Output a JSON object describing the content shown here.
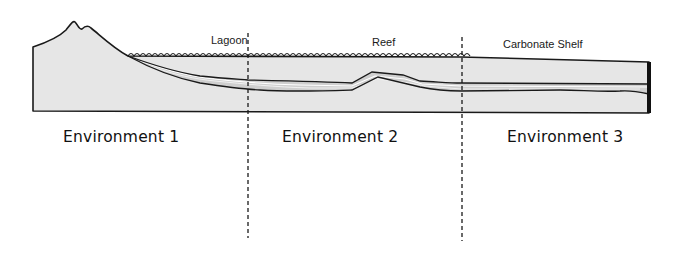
{
  "diagram": {
    "type": "geological cross-section",
    "regions": [
      {
        "label": "Lagoon"
      },
      {
        "label": "Reef"
      },
      {
        "label": "Carbonate Shelf"
      }
    ],
    "environments": [
      {
        "label": "Environment 1"
      },
      {
        "label": "Environment 2"
      },
      {
        "label": "Environment 3"
      }
    ],
    "features": {
      "volcano": "volcanic-island",
      "water_surface": "sea-surface-waves",
      "boundaries": [
        "dashed-boundary-1",
        "dashed-boundary-2"
      ]
    },
    "colors": {
      "rock_fill": "#e6e6e6",
      "sediment_band": "#cfcfcf",
      "outline": "#1a1a1a",
      "background": "#ffffff"
    }
  }
}
